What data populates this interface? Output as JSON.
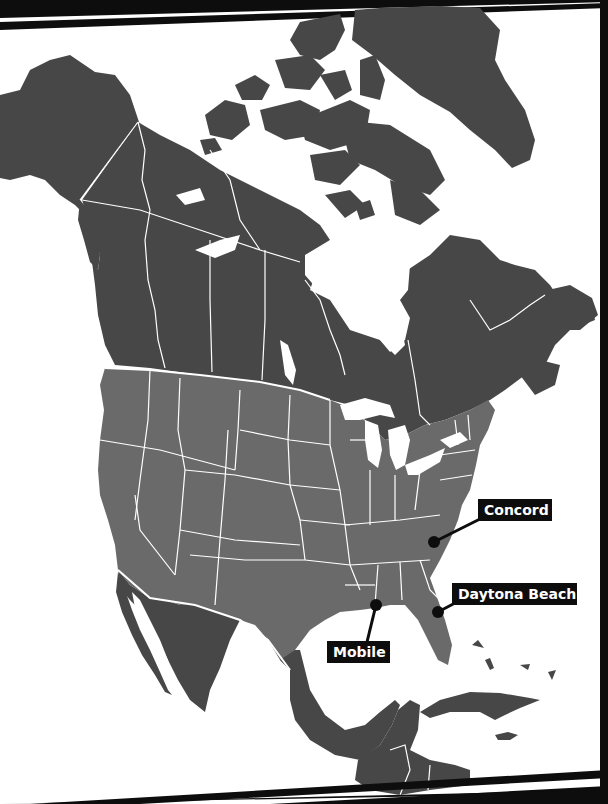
{
  "map": {
    "region": "North America",
    "colors": {
      "background": "#ffffff",
      "us_fill": "#6a6a6a",
      "other_land_fill": "#474747",
      "border_stroke": "#ffffff",
      "frame_stripes": "#0d0d0d",
      "marker": "#0d0d0d",
      "label_bg": "#0d0d0d",
      "label_text": "#ffffff"
    },
    "markers": [
      {
        "name": "Concord",
        "dot": [
          434,
          542
        ],
        "label_box": [
          478,
          499,
          74,
          22
        ],
        "line_to": [
          480,
          519
        ]
      },
      {
        "name": "Daytona Beach",
        "dot": [
          438,
          612
        ],
        "label_box": [
          452,
          583,
          125,
          22
        ],
        "line_to": [
          455,
          603
        ]
      },
      {
        "name": "Mobile",
        "dot": [
          376,
          605
        ],
        "label_box": [
          327,
          641,
          63,
          22
        ],
        "line_to": [
          367,
          642
        ]
      }
    ]
  }
}
